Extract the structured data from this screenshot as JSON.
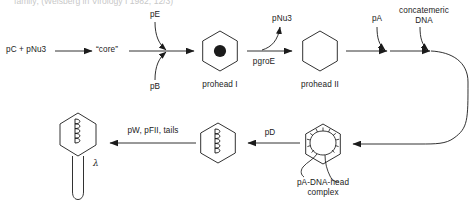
{
  "figure": {
    "kind": "pathway-diagram",
    "background_color": "#ffffff",
    "stroke_color": "#1b1b1b",
    "text_color": "#1b1b1b",
    "truncated_header_text": "family; (Weisberg in Virology I 1982, 12/3)"
  },
  "row1": {
    "substrates_label": "pC + pNu3",
    "core_label": "“core”",
    "cofactor_top_label": "pE",
    "cofactor_bottom_label": "pB",
    "prohead1_label": "prohead I",
    "released_label": "pNu3",
    "catalyst_label": "pgroE",
    "prohead2_label": "prohead II",
    "terminase_label": "pA",
    "dna_label_line1": "concatemeric",
    "dna_label_line2": "DNA"
  },
  "row2": {
    "complex_label_line1": "pA-DNA-head",
    "complex_label_line2": "complex",
    "pd_label": "pD",
    "tails_label": "pW, pFII, tails",
    "phage_label": "λ"
  },
  "shapes": {
    "prohead1": {
      "name": "hexagon-with-core-dot",
      "cx": 220,
      "cy": 51,
      "r": 20
    },
    "prohead2": {
      "name": "empty-hexagon",
      "cx": 320,
      "cy": 51,
      "r": 20
    },
    "pa_dna_head": {
      "name": "hexagon-with-coiled-dna",
      "cx": 323,
      "cy": 144,
      "r": 20
    },
    "filled_head": {
      "name": "hexagon-with-packed-dna",
      "cx": 218,
      "cy": 143,
      "r": 20
    },
    "phage": {
      "name": "hexagon-head-with-tail",
      "cx": 78,
      "cy": 134,
      "r": 21
    }
  }
}
